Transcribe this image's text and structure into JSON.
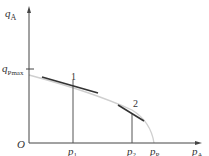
{
  "diagram": {
    "type": "pump-characteristic",
    "axes": {
      "y_label": {
        "main": "q",
        "sub": "A"
      },
      "x_label": {
        "main": "p",
        "sub": "A"
      },
      "origin_label": "O",
      "y_tick": {
        "main": "q",
        "sub": "Pmax"
      }
    },
    "x_ticks": [
      {
        "main": "p",
        "sub": "1"
      },
      {
        "main": "p",
        "sub": "2"
      },
      {
        "main": "p",
        "sub": "P"
      }
    ],
    "points": [
      {
        "label": "1"
      },
      {
        "label": "2"
      }
    ],
    "colors": {
      "axis": "#444444",
      "curve": "#cfcfcf",
      "tangent": "#333333",
      "drop_line": "#555555"
    }
  }
}
